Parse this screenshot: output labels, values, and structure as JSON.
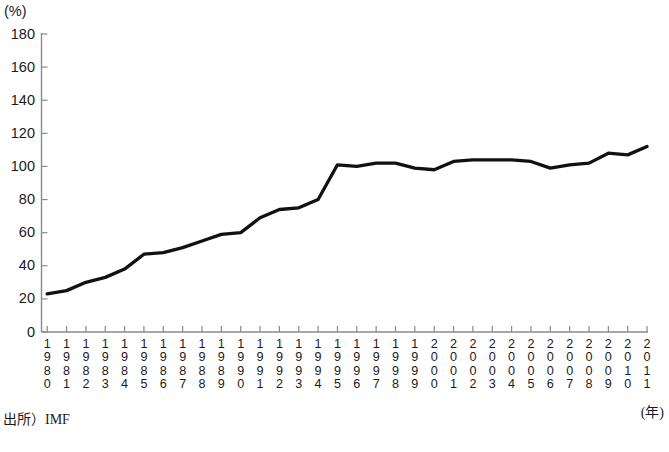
{
  "chart_data": {
    "type": "line",
    "title": "",
    "xlabel": "(年)",
    "ylabel": "(%)",
    "ylim": [
      0,
      180
    ],
    "y_ticks": [
      0,
      20,
      40,
      60,
      80,
      100,
      120,
      140,
      160,
      180
    ],
    "grid": false,
    "legend": null,
    "line_color": "#111111",
    "axis_color": "#8a8a8a",
    "categories": [
      "1980",
      "1981",
      "1982",
      "1983",
      "1984",
      "1985",
      "1986",
      "1987",
      "1988",
      "1989",
      "1990",
      "1991",
      "1992",
      "1993",
      "1994",
      "1995",
      "1996",
      "1997",
      "1998",
      "1999",
      "2000",
      "2001",
      "2002",
      "2003",
      "2004",
      "2005",
      "2006",
      "2007",
      "2008",
      "2009",
      "2010",
      "2011"
    ],
    "values": [
      23,
      25,
      30,
      33,
      38,
      47,
      48,
      51,
      55,
      59,
      60,
      69,
      74,
      75,
      80,
      101,
      100,
      102,
      102,
      99,
      98,
      103,
      104,
      104,
      104,
      103,
      99,
      101,
      102,
      108,
      107,
      112
    ],
    "series": [
      {
        "name": "債務残高対GDP比",
        "values": [
          23,
          25,
          30,
          33,
          38,
          47,
          48,
          51,
          55,
          59,
          60,
          69,
          74,
          75,
          80,
          101,
          100,
          102,
          102,
          99,
          98,
          103,
          104,
          104,
          104,
          103,
          99,
          101,
          102,
          108,
          107,
          112
        ]
      }
    ],
    "annotations": []
  },
  "axis": {
    "y_unit": "(%)",
    "y_tick_labels": [
      "180",
      "160",
      "140",
      "120",
      "100",
      "80",
      "60",
      "40",
      "20",
      "0"
    ],
    "x_unit": "(年)",
    "x_tick_labels": [
      "1980",
      "1981",
      "1982",
      "1983",
      "1984",
      "1985",
      "1986",
      "1987",
      "1988",
      "1989",
      "1990",
      "1991",
      "1992",
      "1993",
      "1994",
      "1995",
      "1996",
      "1997",
      "1998",
      "1999",
      "2000",
      "2001",
      "2002",
      "2003",
      "2004",
      "2005",
      "2006",
      "2007",
      "2008",
      "2009",
      "2010",
      "2011"
    ]
  },
  "footer": {
    "source": "出所）IMF"
  },
  "header": {
    "title_fragment": ""
  }
}
